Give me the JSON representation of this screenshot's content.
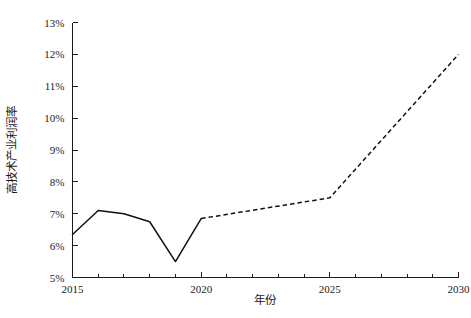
{
  "chart_data": {
    "type": "line",
    "title": "",
    "xlabel": "年份",
    "ylabel": "高技术产业利润率",
    "xlim": [
      2015,
      2030
    ],
    "ylim": [
      5,
      13
    ],
    "grid": false,
    "legend": "none",
    "x_ticks_major": [
      "2015",
      "2020",
      "2025",
      "2030"
    ],
    "x_ticks_major_values": [
      2015,
      2020,
      2025,
      2030
    ],
    "x_ticks_minor_values": [
      2016,
      2017,
      2018,
      2019,
      2021,
      2022,
      2023,
      2024,
      2026,
      2027,
      2028,
      2029
    ],
    "y_ticks": [
      "5%",
      "6%",
      "7%",
      "8%",
      "9%",
      "10%",
      "11%",
      "12%",
      "13%"
    ],
    "y_tick_values": [
      5,
      6,
      7,
      8,
      9,
      10,
      11,
      12,
      13
    ],
    "y_unit": "%",
    "series": [
      {
        "name": "历史值",
        "style": "solid",
        "color": "#111111",
        "x": [
          2015,
          2016,
          2017,
          2018,
          2019,
          2020
        ],
        "values": [
          6.35,
          7.1,
          7.0,
          6.75,
          5.5,
          6.85
        ]
      },
      {
        "name": "预测值",
        "style": "dashed",
        "color": "#111111",
        "x": [
          2020,
          2025,
          2030
        ],
        "values": [
          6.85,
          7.5,
          12.0
        ]
      }
    ]
  },
  "axis_titles": {
    "y": "高技术产业利润率",
    "x": "年份"
  }
}
